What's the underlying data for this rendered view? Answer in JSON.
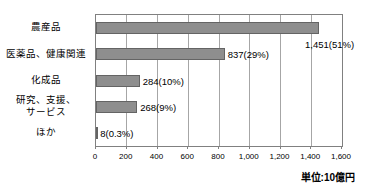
{
  "chart_data": {
    "type": "bar",
    "orientation": "horizontal",
    "title": "",
    "categories": [
      "農産品",
      "医薬品、健康関連",
      "化成品",
      "研究、支援、\nサービス",
      "ほか"
    ],
    "values": [
      1451,
      837,
      284,
      268,
      8
    ],
    "value_labels": [
      "1,451(51%)",
      "837(29%)",
      "284(10%)",
      "268(9%)",
      "8(0.3%)"
    ],
    "percentages": [
      51,
      29,
      10,
      9,
      0.3
    ],
    "x_ticks": [
      "0",
      "200",
      "400",
      "600",
      "800",
      "1,000",
      "1,200",
      "1,400",
      "1,600"
    ],
    "xlim": [
      0,
      1600
    ],
    "xlabel": "",
    "ylabel": "",
    "unit_note": "単位:10億円",
    "legend": "none",
    "grid": "vertical",
    "bar_color": "#8e8e8e",
    "bar_border_color": "#646464",
    "grid_color": "#a6a6a6",
    "axis_color": "#808080",
    "first_label_placement": "below-end"
  }
}
